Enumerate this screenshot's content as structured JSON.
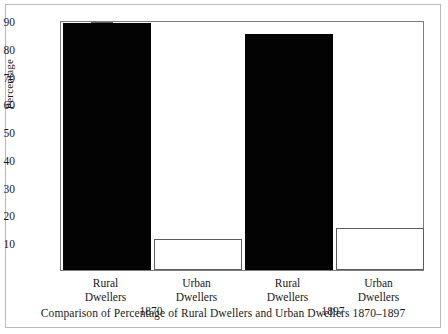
{
  "chart_data": {
    "type": "bar",
    "title": "",
    "caption": "Comparison of Percentage of Rural Dwellers and Urban Dwellers 1870–1897",
    "xlabel": "",
    "ylabel": "Percentage",
    "ylim": [
      0,
      90
    ],
    "yticks": [
      10,
      20,
      30,
      40,
      50,
      60,
      70,
      80,
      90
    ],
    "ytick_labels": [
      "10",
      "20",
      "30",
      "40",
      "50",
      "60",
      "70",
      "80",
      "90"
    ],
    "grid": false,
    "legend": "none",
    "groups": [
      {
        "label": "1870",
        "bars": [
          {
            "category": "Rural Dwellers",
            "line1": "Rural",
            "line2": "Dwellers",
            "value": 89,
            "style": "filled"
          },
          {
            "category": "Urban Dwellers",
            "line1": "Urban",
            "line2": "Dwellers",
            "value": 11,
            "style": "hollow"
          }
        ]
      },
      {
        "label": "1897",
        "bars": [
          {
            "category": "Rural Dwellers",
            "line1": "Rural",
            "line2": "Dwellers",
            "value": 85,
            "style": "filled"
          },
          {
            "category": "Urban Dwellers",
            "line1": "Urban",
            "line2": "Dwellers",
            "value": 15,
            "style": "hollow"
          }
        ]
      }
    ],
    "categories": [
      "Rural Dwellers 1870",
      "Urban Dwellers 1870",
      "Rural Dwellers 1897",
      "Urban Dwellers 1897"
    ],
    "values": [
      89,
      11,
      85,
      15
    ],
    "colors": {
      "filled": "#030303",
      "hollow": "#ffffff",
      "outline": "#5d5d5d",
      "axis": "#7d7d7d"
    }
  }
}
